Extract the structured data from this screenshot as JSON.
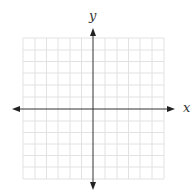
{
  "diagram": {
    "type": "coordinate-plane",
    "x_label": "x",
    "y_label": "y",
    "grid": {
      "columns": 12,
      "rows": 12,
      "color": "#e3e3e3"
    },
    "axis_color": "#333333"
  }
}
